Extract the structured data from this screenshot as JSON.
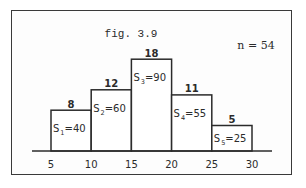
{
  "chart_data": {
    "type": "bar",
    "title": "fig. 3.9",
    "annotation": "n = 54",
    "x_ticks": [
      "5",
      "10",
      "15",
      "20",
      "25",
      "30"
    ],
    "bins": [
      {
        "from": 5,
        "to": 10,
        "value": 8,
        "label_main": "S",
        "label_sub": "1",
        "label_rest": "=40"
      },
      {
        "from": 10,
        "to": 15,
        "value": 12,
        "label_main": "S",
        "label_sub": "2",
        "label_rest": "=60"
      },
      {
        "from": 15,
        "to": 20,
        "value": 18,
        "label_main": "S",
        "label_sub": "3",
        "label_rest": "=90"
      },
      {
        "from": 20,
        "to": 25,
        "value": 11,
        "label_main": "S",
        "label_sub": "4",
        "label_rest": "=55"
      },
      {
        "from": 25,
        "to": 30,
        "value": 5,
        "label_main": "S",
        "label_sub": "5",
        "label_rest": "=25"
      }
    ],
    "xlim": [
      5,
      30
    ],
    "ylim": [
      0,
      18
    ],
    "xlabel": "",
    "ylabel": "",
    "grid": false,
    "legend": "none",
    "colors": {
      "stroke": "#2b2b2b",
      "fill": "#ffffff",
      "text": "#2b2b2b"
    }
  }
}
